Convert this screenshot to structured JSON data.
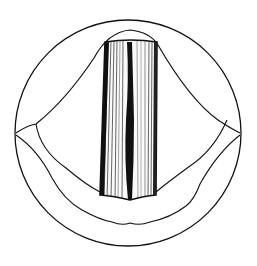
{
  "figure": {
    "type": "line-illustration",
    "colors": {
      "background": "#ffffff",
      "ink": "#111111"
    }
  }
}
